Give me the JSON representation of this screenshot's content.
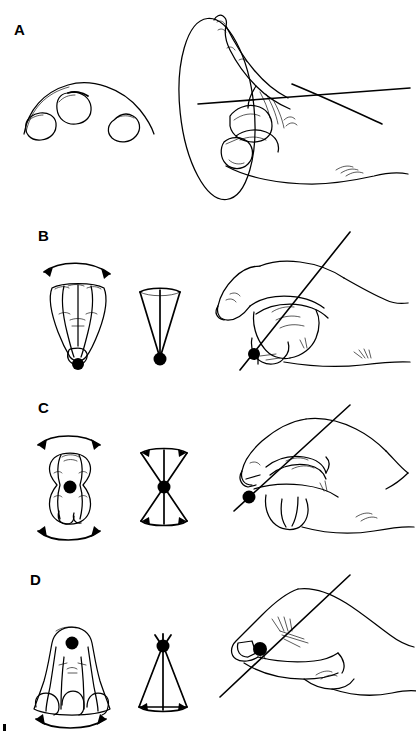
{
  "figure": {
    "background_color": "#ffffff",
    "ink_color": "#000000",
    "width": 416,
    "height": 733,
    "style": "black-and-white line drawing"
  },
  "panels": [
    {
      "label": "A",
      "label_x": 14,
      "label_y": 22,
      "description": "Three fingertip pads along a curved arc at left; at right a hand with extended index finger and a large ellipse indicating a circular path, crossed by two straight axis lines.",
      "motion": "circular / conical rotation",
      "elements": {
        "left_diagram": "three fingertip pads on arc",
        "middle_diagram": "none",
        "right_diagram": "hand in side view with ellipse and axis lines",
        "pivot_dot": "false",
        "arrows": "none",
        "ellipse": "true",
        "axis_lines": 2
      }
    },
    {
      "label": "B",
      "label_x": 38,
      "label_y": 228,
      "description": "Fingers splayed in frontal view with a double-headed arc arrow above and a pivot dot at the base; a narrow upright cone with apex dot at its base; a hand with a straight axis line passing through the fingertip pivot dot.",
      "motion": "side-to-side (adduction/abduction) about distal pivot",
      "elements": {
        "left_diagram": "splayed fingers with arc arrow above",
        "middle_diagram": "narrow cone, apex at bottom",
        "right_diagram": "hand with diagonal axis line through pivot dot",
        "pivot_dot": "true",
        "arrows": "double-headed arc above",
        "ellipse": "false",
        "axis_lines": 1
      }
    },
    {
      "label": "C",
      "label_x": 38,
      "label_y": 400,
      "description": "Finger in frontal view with double-headed arc arrows both above and below and a pivot dot at its center; a bowtie double-cone with the dot at the waist; a hand with a straight axis line crossing the fingertip dot.",
      "motion": "rocking about a mid-pad pivot (two opposed cones)",
      "elements": {
        "left_diagram": "finger with arc arrows above and below",
        "middle_diagram": "bowtie double cone, dot at waist",
        "right_diagram": "hand with diagonal axis line through pivot dot",
        "pivot_dot": "true",
        "arrows": "two double-headed arcs",
        "ellipse": "false",
        "axis_lines": 1
      }
    },
    {
      "label": "D",
      "label_x": 30,
      "label_y": 572,
      "description": "Fingers in frontal view with a pivot dot high on the pad and a double-headed arc arrow below; an upright cone with apex dot at the top widening downward; a hand in near-flat view with a straight axis line through the fingertip dot.",
      "motion": "sweeping about a proximal pivot",
      "elements": {
        "left_diagram": "fingers with dot near top, arc arrow below",
        "middle_diagram": "cone, apex dot at top",
        "right_diagram": "flat hand with diagonal axis line through pivot dot",
        "pivot_dot": "true",
        "arrows": "double-headed arc below",
        "ellipse": "false",
        "axis_lines": 1
      }
    }
  ]
}
